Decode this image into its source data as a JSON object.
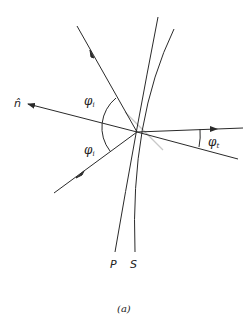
{
  "diagram": {
    "labels": {
      "normal": "n̂",
      "phi_i_upper": "φ",
      "phi_i_lower": "φ",
      "phi_i_sub": "i",
      "phi_t": "φ",
      "phi_t_sub": "t",
      "curve_p": "P",
      "curve_s": "S",
      "caption": "(a)"
    },
    "colors": {
      "line": "#2a2a2a",
      "tangent": "#c8c8c8",
      "background": "#ffffff"
    }
  }
}
